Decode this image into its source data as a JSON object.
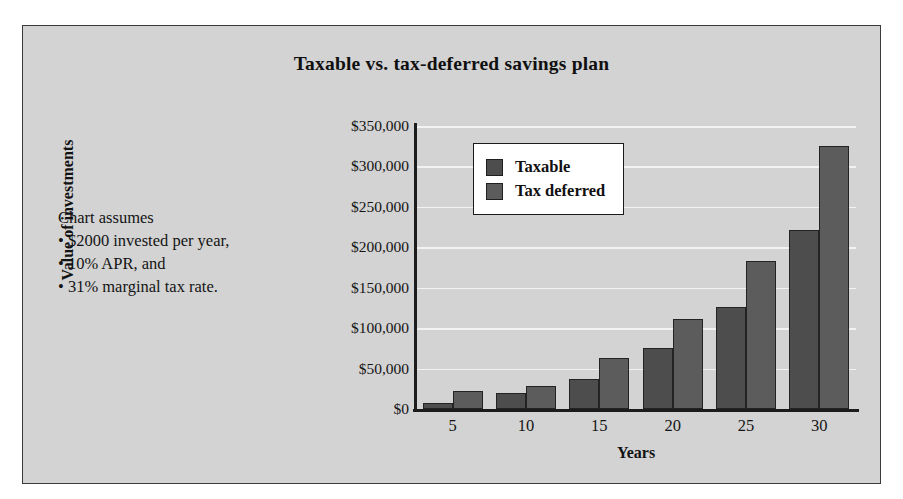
{
  "panel": {
    "background_color": "#d3d3d3",
    "border_color": "#3a3a3a"
  },
  "assumptions": {
    "heading": "Chart assumes",
    "items": [
      "• $2000 invested per year,",
      "• 10% APR, and",
      "• 31% marginal tax rate."
    ]
  },
  "legend": {
    "position": "top-left-inside-plot",
    "entries": [
      {
        "label": "Taxable",
        "color": "#4d4d4d"
      },
      {
        "label": "Tax deferred",
        "color": "#5c5c5c"
      }
    ]
  },
  "chart_data": {
    "type": "bar",
    "title": "Taxable vs. tax-deferred savings plan",
    "xlabel": "Years",
    "ylabel": "Value of investments",
    "categories": [
      "5",
      "10",
      "15",
      "20",
      "25",
      "30"
    ],
    "ylim": [
      0,
      350000
    ],
    "ytick_values": [
      0,
      50000,
      100000,
      150000,
      200000,
      250000,
      300000,
      350000
    ],
    "ytick_labels": [
      "$0",
      "$50,000",
      "$100,000",
      "$150,000",
      "$200,000",
      "$250,000",
      "$300,000",
      "$350,000"
    ],
    "grid": true,
    "legend_position": "upper left",
    "series": [
      {
        "name": "Taxable",
        "color": "#4d4d4d",
        "values": [
          8000,
          20000,
          37000,
          76000,
          126000,
          222000
        ]
      },
      {
        "name": "Tax deferred",
        "color": "#5c5c5c",
        "values": [
          22000,
          29000,
          63000,
          111000,
          183000,
          325000
        ]
      }
    ]
  }
}
